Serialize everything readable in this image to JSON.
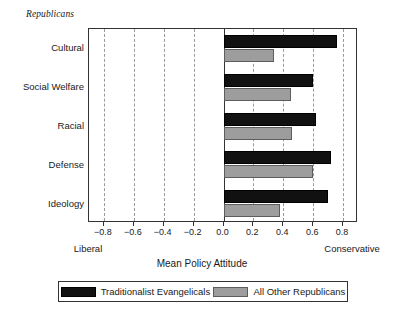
{
  "group_title": "Republicans",
  "axis": {
    "x_title": "Mean Policy Attitude",
    "left_pole": "Liberal",
    "right_pole": "Conservative"
  },
  "legend": {
    "entries": [
      {
        "label": "Traditionalist Evangelicals",
        "color": "#111111",
        "swatch": "black-swatch"
      },
      {
        "label": "All Other Republicans",
        "color": "#9d9d9d",
        "swatch": "gray-swatch"
      }
    ]
  },
  "chart_data": {
    "type": "bar",
    "orientation": "horizontal",
    "title": "Republicans",
    "xlabel": "Mean Policy Attitude",
    "ylabel": "",
    "xlim": [
      -0.9,
      0.9
    ],
    "xticks": [
      -0.8,
      -0.6,
      -0.4,
      -0.2,
      0.0,
      0.2,
      0.4,
      0.6,
      0.8
    ],
    "xticklabels": [
      "−0.8",
      "−0.6",
      "−0.4",
      "−0.2",
      "0.0",
      "0.2",
      "0.4",
      "0.6",
      "0.8"
    ],
    "grid": "vertical-dashed",
    "zero_line": 0.0,
    "legend_position": "below",
    "axis_pole_labels": {
      "left": "Liberal",
      "right": "Conservative"
    },
    "categories": [
      "Cultural",
      "Social Welfare",
      "Racial",
      "Defense",
      "Ideology"
    ],
    "series": [
      {
        "name": "Traditionalist Evangelicals",
        "color": "#111111",
        "values": [
          0.76,
          0.6,
          0.62,
          0.72,
          0.7
        ]
      },
      {
        "name": "All Other Republicans",
        "color": "#9d9d9d",
        "values": [
          0.34,
          0.45,
          0.46,
          0.6,
          0.375
        ]
      }
    ]
  }
}
